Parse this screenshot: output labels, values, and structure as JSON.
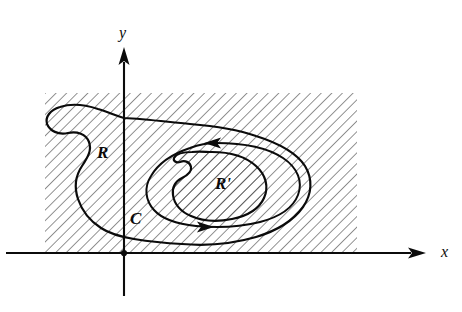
{
  "figure": {
    "type": "math-region-diagram",
    "background_color": "#ffffff",
    "ink_color": "#0b0b0b",
    "hatch_color": "#3a3a3a"
  },
  "axes": {
    "x_axis": {
      "label": "x",
      "label_x": 441,
      "label_y": 257,
      "line_start_x": 6,
      "line_end_x": 411,
      "y": 253,
      "arrow_tip_x": 426,
      "has_arrow": true
    },
    "y_axis": {
      "label": "y",
      "label_x": 119,
      "label_y": 38,
      "line_top_y": 62,
      "line_bottom_y": 296,
      "x": 124,
      "arrow_tip_y": 47,
      "has_arrow": true
    },
    "origin": {
      "x": 124,
      "y": 253
    }
  },
  "hatched_rectangle": {
    "name": "exterior-hatched-band",
    "x": 45,
    "y": 93,
    "width": 312,
    "height": 160,
    "hatch_angle_deg": 45,
    "hatch_spacing_px": 7.5,
    "hatch_stroke_width": 1.1
  },
  "labels": {
    "region_outer": {
      "text": "R",
      "x": 97,
      "y": 158,
      "font_size": 17
    },
    "curve_outer": {
      "text": "C",
      "x": 130,
      "y": 224,
      "font_size": 17
    },
    "region_inner": {
      "text": "R'",
      "x": 215,
      "y": 189,
      "font_size": 17
    }
  },
  "curves": {
    "outer_boundary": {
      "name": "region-R-boundary",
      "closed": true,
      "stroke_width": 2.2,
      "path": "M 124 118 C 146 119 168 122 190 124 C 214 126 236 129 256 136 C 278 143 296 152 305 166 C 313 179 312 194 303 207 C 293 221 276 231 256 237 C 232 244 206 246 182 244 C 162 243 146 241 134 239 C 122 237 110 234 101 228 C 90 221 82 211 78 199 C 74 187 76 175 82 166 C 88 157 92 150 89 142 C 86 134 77 131 68 133 C 58 135 50 131 47 124 C 45 117 50 110 60 107 C 72 103 86 105 98 109 C 108 112 116 116 124 118 Z"
    },
    "inner_curve_C": {
      "name": "curve-C-oriented",
      "closed": true,
      "stroke_width": 2.0,
      "path": "M 216 143 C 244 143 268 148 283 158 C 298 168 303 182 298 195 C 293 208 279 217 260 222 C 240 227 216 228 196 226 C 177 224 162 219 154 210 C 145 200 144 187 151 176 C 158 164 172 154 190 148 C 198 145 207 143 216 143 Z"
    },
    "inner_blob_Rprime": {
      "name": "region-R-prime-boundary",
      "closed": true,
      "stroke_width": 2.2,
      "path": "M 212 152 C 230 152 246 157 256 166 C 266 175 269 187 264 198 C 259 209 247 216 232 219 C 217 222 202 221 191 216 C 181 212 174 204 173 195 C 172 187 176 181 182 178 C 188 175 192 172 191 167 C 190 162 185 160 180 162 C 176 163 173 161 174 158 C 176 154 183 152 192 152 C 199 151 206 152 212 152 Z"
    }
  },
  "arrows": [
    {
      "name": "orientation-arrow-top",
      "direction": "left",
      "tip_x": 204,
      "tip_y": 143,
      "size": 9
    },
    {
      "name": "orientation-arrow-bottom",
      "direction": "right",
      "tip_x": 214,
      "tip_y": 227,
      "size": 9
    }
  ]
}
